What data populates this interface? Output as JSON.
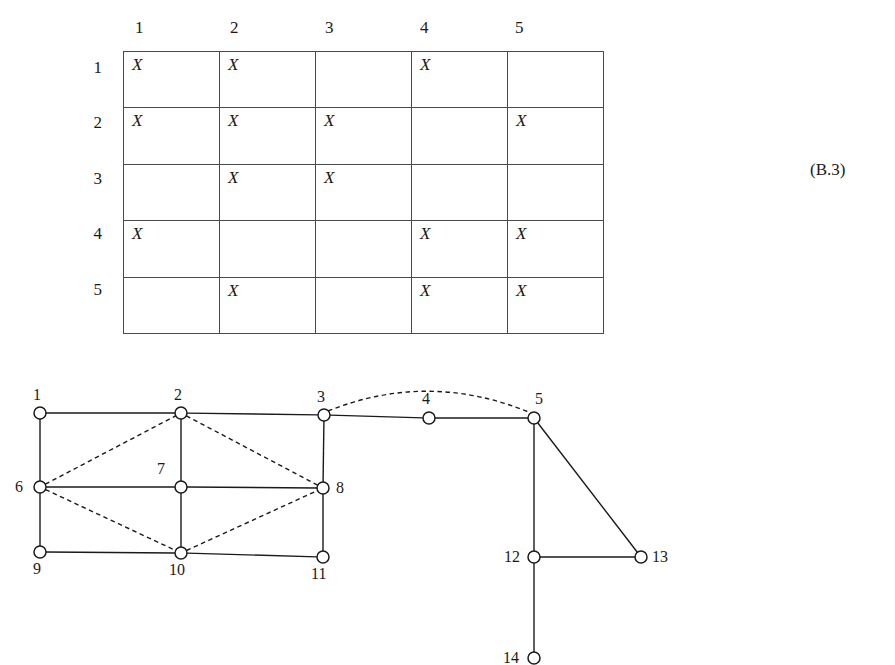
{
  "figure": {
    "equation_tag": "(B.3)"
  },
  "matrix": {
    "type": "table",
    "column_headers": [
      "1",
      "2",
      "3",
      "4",
      "5"
    ],
    "row_headers": [
      "1",
      "2",
      "3",
      "4",
      "5"
    ],
    "mark_symbol": "X",
    "cells": [
      [
        "X",
        "X",
        "",
        "X",
        ""
      ],
      [
        "X",
        "X",
        "X",
        "",
        "X"
      ],
      [
        "",
        "X",
        "X",
        "",
        ""
      ],
      [
        "X",
        "",
        "",
        "X",
        "X"
      ],
      [
        "",
        "X",
        "",
        "X",
        "X"
      ]
    ]
  },
  "graph": {
    "nodes": [
      {
        "id": "1",
        "label": "1",
        "x": 40,
        "y": 43,
        "label_x": 33,
        "label_y": 16
      },
      {
        "id": "2",
        "label": "2",
        "x": 181,
        "y": 43,
        "label_x": 174,
        "label_y": 16
      },
      {
        "id": "3",
        "label": "3",
        "x": 324,
        "y": 45,
        "label_x": 317,
        "label_y": 18
      },
      {
        "id": "4",
        "label": "4",
        "x": 429,
        "y": 48,
        "label_x": 422,
        "label_y": 20
      },
      {
        "id": "5",
        "label": "5",
        "x": 534,
        "y": 48,
        "label_x": 535,
        "label_y": 20
      },
      {
        "id": "6",
        "label": "6",
        "x": 40,
        "y": 117,
        "label_x": 15,
        "label_y": 108
      },
      {
        "id": "7",
        "label": "7",
        "x": 181,
        "y": 117,
        "label_x": 157,
        "label_y": 90
      },
      {
        "id": "8",
        "label": "8",
        "x": 323,
        "y": 118,
        "label_x": 336,
        "label_y": 109
      },
      {
        "id": "9",
        "label": "9",
        "x": 40,
        "y": 182,
        "label_x": 33,
        "label_y": 190
      },
      {
        "id": "10",
        "label": "10",
        "x": 181,
        "y": 183,
        "label_x": 169,
        "label_y": 191
      },
      {
        "id": "11",
        "label": "11",
        "x": 323,
        "y": 187,
        "label_x": 311,
        "label_y": 195
      },
      {
        "id": "12",
        "label": "12",
        "x": 534,
        "y": 187,
        "label_x": 504,
        "label_y": 178
      },
      {
        "id": "13",
        "label": "13",
        "x": 641,
        "y": 187,
        "label_x": 652,
        "label_y": 178
      },
      {
        "id": "14",
        "label": "14",
        "x": 534,
        "y": 288,
        "label_x": 503,
        "label_y": 279
      }
    ],
    "edges_solid": [
      [
        "1",
        "2"
      ],
      [
        "2",
        "3"
      ],
      [
        "3",
        "4"
      ],
      [
        "4",
        "5"
      ],
      [
        "1",
        "6"
      ],
      [
        "6",
        "9"
      ],
      [
        "2",
        "7"
      ],
      [
        "7",
        "10"
      ],
      [
        "3",
        "8"
      ],
      [
        "8",
        "11"
      ],
      [
        "6",
        "7"
      ],
      [
        "7",
        "8"
      ],
      [
        "9",
        "10"
      ],
      [
        "10",
        "11"
      ],
      [
        "5",
        "12"
      ],
      [
        "5",
        "13"
      ],
      [
        "12",
        "13"
      ],
      [
        "12",
        "14"
      ]
    ],
    "edges_dashed": [
      [
        "6",
        "2"
      ],
      [
        "2",
        "8"
      ],
      [
        "6",
        "10"
      ],
      [
        "10",
        "8"
      ]
    ],
    "edges_dashed_arc": [
      {
        "from": "3",
        "to": "5",
        "sag": -46
      }
    ],
    "node_radius": 6
  },
  "colors": {
    "ink": "#1a1a1a",
    "rule": "#4a4a4a",
    "paper": "#ffffff"
  }
}
